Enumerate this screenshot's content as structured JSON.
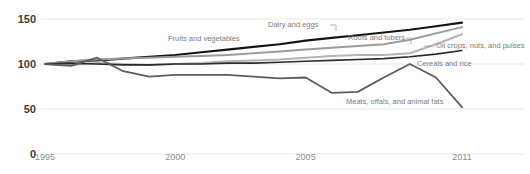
{
  "chart_data": {
    "type": "line",
    "title": "",
    "xlabel": "",
    "ylabel": "",
    "xlim": [
      1995,
      2011
    ],
    "ylim": [
      0,
      150
    ],
    "grid": false,
    "legend_position": "inline-annotations",
    "y_ticks": [
      "150",
      "100",
      "50",
      "0"
    ],
    "y_tick_values": [
      150,
      100,
      50,
      0
    ],
    "x_ticks": [
      "1995",
      "2000",
      "2005",
      "2011"
    ],
    "x_tick_values": [
      1995,
      2000,
      2005,
      2011
    ],
    "x": [
      1995,
      1996,
      1997,
      1998,
      1999,
      2000,
      2001,
      2002,
      2003,
      2004,
      2005,
      2006,
      2007,
      2008,
      2009,
      2010,
      2011
    ],
    "series": [
      {
        "name": "Dairy and eggs",
        "color": "#141414",
        "width": 2.1,
        "values": [
          100,
          103,
          104,
          106,
          108,
          110,
          113,
          116,
          119,
          122,
          126,
          129,
          132,
          135,
          138,
          142,
          146
        ]
      },
      {
        "name": "Roots and tubers",
        "color": "#9b9b9b",
        "width": 2.0,
        "values": [
          100,
          103,
          105,
          106,
          107,
          108,
          109,
          110,
          112,
          114,
          116,
          118,
          120,
          122,
          127,
          134,
          141
        ]
      },
      {
        "name": "Oil crops, nuts, and pulses",
        "color": "#b4b4b4",
        "width": 2.0,
        "values": [
          100,
          99,
          101,
          100,
          99,
          100,
          101,
          103,
          104,
          105,
          107,
          109,
          110,
          110,
          112,
          122,
          133
        ]
      },
      {
        "name": "Cereals and rice",
        "color": "#2a2a2a",
        "width": 1.6,
        "values": [
          100,
          101,
          100,
          99,
          99,
          100,
          100,
          101,
          101,
          102,
          103,
          104,
          105,
          106,
          108,
          111,
          115
        ]
      },
      {
        "name": "Meats, offals, and animal fats",
        "color": "#5c5c5c",
        "width": 1.8,
        "values": [
          100,
          98,
          107,
          92,
          86,
          88,
          88,
          88,
          86,
          84,
          85,
          68,
          69,
          85,
          100,
          85,
          52
        ]
      }
    ],
    "annotations": [
      {
        "text": "Fruits and vegetables",
        "x": 168,
        "y": 41,
        "leader": false
      },
      {
        "text": "Dairy and eggs",
        "x": 268,
        "y": 27,
        "leader": true,
        "leader_path": "M 330 25 L 336 25 L 336 31"
      },
      {
        "text": "Roots and tubers",
        "x": 348,
        "y": 40,
        "leader": true,
        "leader_path": "M 406 38 L 411 38 L 411 44"
      },
      {
        "text": "Oil crops, nuts, and pulses",
        "x": 436,
        "y": 48,
        "leader": true,
        "leader_path": "M 424 46 L 433 46"
      },
      {
        "text": "Cereals and rice",
        "x": 417,
        "y": 66,
        "leader": false
      },
      {
        "text": "Meats, offals, and animal fats",
        "x": 346,
        "y": 104,
        "leader": false
      }
    ]
  }
}
